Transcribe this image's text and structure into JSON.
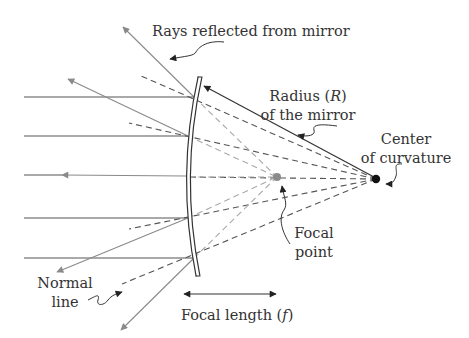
{
  "diagram": {
    "labels": {
      "rays_reflected": "Rays reflected from mirror",
      "radius_line1": "Radius (",
      "radius_symbol": "R",
      "radius_close": ")",
      "radius_line2": "of the mirror",
      "center_line1": "Center",
      "center_line2": "of curvature",
      "focal_point_line1": "Focal",
      "focal_point_line2": "point",
      "normal_line1": "Normal",
      "normal_line2": "line",
      "focal_length_prefix": "Focal length (",
      "focal_length_symbol": "f",
      "focal_length_suffix": ")"
    },
    "colors": {
      "incident_ray": "#555555",
      "reflected_ray": "#8a8a8a",
      "focal_point": "#8a8a8a",
      "center_point": "#111111",
      "mirror": "#333333"
    },
    "points": {
      "focal_point": {
        "x": 277,
        "y": 177
      },
      "center_of_curvature": {
        "x": 376,
        "y": 179
      }
    },
    "incident_rays_y": [
      97,
      136,
      177,
      218,
      258
    ]
  }
}
